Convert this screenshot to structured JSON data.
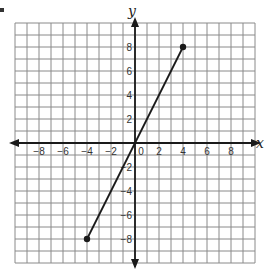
{
  "problem_marker": ".",
  "chart_data": {
    "type": "line",
    "title": "",
    "xlabel": "x",
    "ylabel": "y",
    "xlim": [
      -10,
      10
    ],
    "ylim": [
      -10,
      10
    ],
    "grid": true,
    "grid_step": 1,
    "x_ticks": [
      -8,
      -6,
      -4,
      -2,
      0,
      2,
      4,
      6,
      8
    ],
    "y_ticks": [
      8,
      6,
      4,
      2,
      -2,
      -4,
      -6,
      -8
    ],
    "x_tick_labels": [
      "−8",
      "−6",
      "−4",
      "−2",
      "0",
      "2",
      "4",
      "6",
      "8"
    ],
    "y_tick_labels": [
      "8",
      "6",
      "4",
      "2",
      "−2",
      "−4",
      "−6",
      "−8"
    ],
    "series": [
      {
        "name": "segment",
        "type": "line-segment",
        "points": [
          {
            "x": -4,
            "y": -8
          },
          {
            "x": 4,
            "y": 8
          }
        ],
        "endpoints_marked": true
      }
    ],
    "colors": {
      "grid": "#8a8a8a",
      "axis": "#1a1a1a",
      "line": "#1a1a1a"
    }
  }
}
